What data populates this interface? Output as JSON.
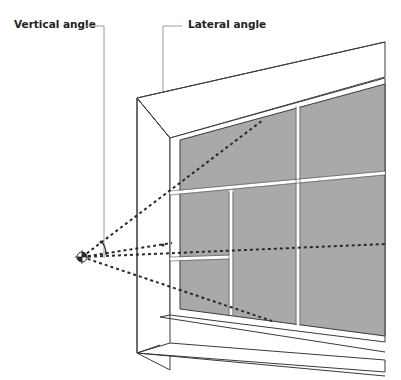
{
  "labels": {
    "vertical_angle": "Vertical angle",
    "lateral_angle": "Lateral angle"
  },
  "colors": {
    "glass": "#a9a9a9",
    "line": "#3a3a3a",
    "leader": "#9a9a9a",
    "dash": "#2a2a2a",
    "background": "#ffffff"
  },
  "diagram": {
    "viewpoint_marker": "eye-point-target",
    "sight_lines": 4,
    "angle_arc": "vertical-angle-arc"
  }
}
